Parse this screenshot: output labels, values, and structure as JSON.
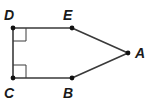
{
  "diagram": {
    "type": "geometry-figure",
    "shape": "pentagon",
    "points": [
      {
        "name": "D",
        "label": "D",
        "x": 13,
        "y": 28,
        "lx": 4,
        "ly": 20
      },
      {
        "name": "E",
        "label": "E",
        "x": 72,
        "y": 28,
        "lx": 63,
        "ly": 20
      },
      {
        "name": "A",
        "label": "A",
        "x": 128,
        "y": 53,
        "lx": 135,
        "ly": 58
      },
      {
        "name": "B",
        "label": "B",
        "x": 72,
        "y": 78,
        "lx": 63,
        "ly": 98
      },
      {
        "name": "C",
        "label": "C",
        "x": 13,
        "y": 78,
        "lx": 4,
        "ly": 98
      }
    ],
    "segments": [
      [
        "D",
        "E"
      ],
      [
        "E",
        "A"
      ],
      [
        "A",
        "B"
      ],
      [
        "B",
        "C"
      ],
      [
        "C",
        "D"
      ]
    ],
    "right_angles": [
      "D",
      "C"
    ],
    "colors": {
      "stroke": "#3a3a3a",
      "point": "#111111",
      "label": "#1a1a1a",
      "background": "#ffffff"
    }
  }
}
